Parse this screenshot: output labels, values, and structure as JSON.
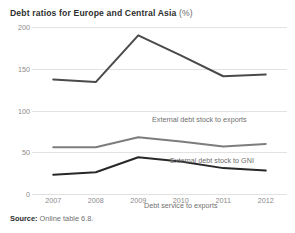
{
  "chart_data": {
    "type": "line",
    "title": "Debt ratios for Europe and Central Asia",
    "title_unit": "(%)",
    "xlabel": "",
    "ylabel": "",
    "categories": [
      "2007",
      "2008",
      "2009",
      "2010",
      "2011",
      "2012"
    ],
    "x": [
      2007,
      2008,
      2009,
      2010,
      2011,
      2012
    ],
    "ylim": [
      0,
      200
    ],
    "yticks": [
      0,
      50,
      100,
      150,
      200
    ],
    "ytick_labels": [
      "0",
      "50",
      "100",
      "150",
      "200"
    ],
    "grid": true,
    "grid_axis": "y",
    "legend_position": "inline-annotations",
    "series": [
      {
        "name": "External debt stock to exports",
        "color": "#4a4a4a",
        "values": [
          137,
          134,
          190,
          166,
          141,
          143
        ]
      },
      {
        "name": "External debt stock to GNI",
        "color": "#7d7d7d",
        "values": [
          56,
          56,
          68,
          63,
          57,
          60
        ]
      },
      {
        "name": "Debt service to exports",
        "color": "#282828",
        "values": [
          23,
          26,
          44,
          39,
          31,
          28
        ]
      }
    ],
    "annotations": [
      "External debt stock to exports",
      "External debt stock to GNI",
      "Debt service to exports"
    ]
  },
  "source": {
    "label": "Source:",
    "text": "Online table 6.8."
  }
}
